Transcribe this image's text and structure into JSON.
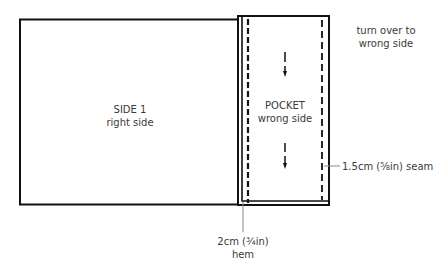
{
  "diagram": {
    "side1": {
      "title": "SIDE 1",
      "subtitle": "right side"
    },
    "pocket": {
      "title": "POCKET",
      "subtitle": "wrong side"
    },
    "instruction": {
      "line1": "turn over to",
      "line2": "wrong side"
    },
    "seam_label": "1.5cm (⅝in) seam",
    "hem_label": {
      "line1": "2cm (¾in)",
      "line2": "hem"
    },
    "colors": {
      "line": "#111111",
      "text": "#3a3a3a",
      "leader": "#888888"
    }
  }
}
